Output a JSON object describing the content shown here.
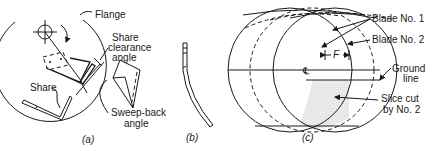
{
  "figure": {
    "panel_a": {
      "caption": "(a)",
      "labels": {
        "flange": "Flange",
        "share_clearance_line1": "Share",
        "share_clearance_line2": "clearance",
        "share_clearance_line3": "angle",
        "share": "Share",
        "sweep_back_line1": "Sweep-back",
        "sweep_back_line2": "angle"
      }
    },
    "panel_b": {
      "caption": "(b)"
    },
    "panel_c": {
      "caption": "(c)",
      "labels": {
        "blade_no_1": "Blade No. 1",
        "blade_no_2": "Blade No. 2",
        "centerline": "℄",
        "dimension_f": "F",
        "ground_line_1": "Ground",
        "ground_line_2": "line",
        "slice_cut_1": "Slice cut",
        "slice_cut_2": "by No. 2"
      }
    },
    "colors": {
      "line": "#1a1a1a",
      "shading": "#d9d9d9",
      "background": "#ffffff"
    }
  }
}
